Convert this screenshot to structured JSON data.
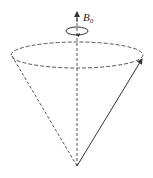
{
  "diagram": {
    "field_label": "B",
    "field_subscript": "0",
    "elements": [
      {
        "name": "field-axis",
        "type": "dashed vertical line with arrow up"
      },
      {
        "name": "rotation-loop",
        "type": "small ellipse with arrow indicating rotation"
      },
      {
        "name": "cone-base",
        "type": "dashed ellipse"
      },
      {
        "name": "cone-edge",
        "type": "dashed line from apex to left of base"
      },
      {
        "name": "moment-vector",
        "type": "solid arrow from apex to right of base"
      }
    ],
    "colors": {
      "line": "#333333",
      "dashed": "#555555",
      "background": "#ffffff"
    }
  }
}
